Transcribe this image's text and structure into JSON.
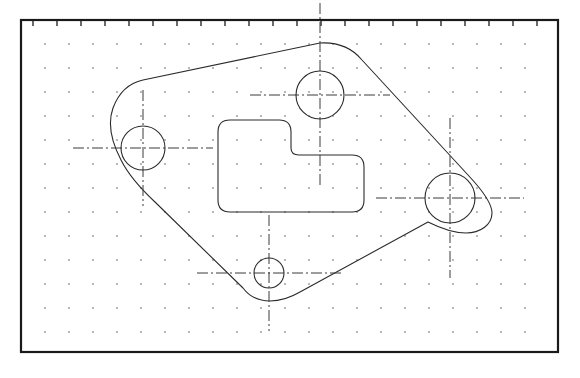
{
  "document": {
    "title_fragment": "CAD VIEW",
    "drawing_name": "gasket-plate-outline"
  },
  "canvas": {
    "width": 580,
    "height": 378,
    "background_color": "#ffffff"
  },
  "border": {
    "name": "drawing-frame",
    "x": 21,
    "y": 20,
    "width": 537,
    "height": 332,
    "stroke_color": "#1a1a1a",
    "stroke_width": 2.2
  },
  "ruler": {
    "name": "top-scale-bar",
    "tick_count": 22,
    "tick_spacing": 24,
    "tick_length": 5,
    "start_x": 33,
    "y": 21,
    "stroke_color": "#2b2b2b"
  },
  "grid": {
    "name": "snap-grid",
    "spacing": 24,
    "origin_x": 45,
    "origin_y": 44,
    "cols": 21,
    "rows": 13,
    "dot_color": "#8a8a8a",
    "dot_size": 1.1
  },
  "geometry": {
    "stroke_color": "#2a2a2a",
    "stroke_width": 1.1,
    "outline": {
      "name": "part-outline",
      "path": "M 143 80 L 320 43 C 338 42 352 48 362 60 L 468 175 C 486 194 492 206 492 213 C 492 225 480 233 466 233 C 452 233 440 228 428 222 L 300 292 C 288 299 278 301 270 301 C 258 301 249 296 243 288 L 155 202 C 140 188 128 174 121 160 C 110 139 108 122 113 108 C 119 92 129 83 143 80 Z",
      "description": "closed irregular plate profile with large left arc, straight top edge, swept right lobe and diagonal bottom edges"
    },
    "pocket": {
      "name": "l-shaped-pocket",
      "path": "M 230 120 L 279 120 Q 291 120 291 132 L 291 148 Q 291 155 299 155 L 352 155 Q 364 155 364 167 L 364 200 Q 364 212 352 212 L 230 212 Q 218 212 218 200 L 218 132 Q 218 120 230 120 Z",
      "corner_radius": 12,
      "description": "mirrored L-shaped interior cutout with filleted corners"
    },
    "holes": [
      {
        "name": "hole-left",
        "cx": 143,
        "cy": 148,
        "r": 22,
        "center_mark_h": 70,
        "center_mark_v": 58
      },
      {
        "name": "hole-top",
        "cx": 320,
        "cy": 95,
        "r": 24,
        "center_mark_h": 70,
        "center_mark_v": 92
      },
      {
        "name": "hole-right",
        "cx": 450,
        "cy": 198,
        "r": 25,
        "center_mark_h": 74,
        "center_mark_v": 80
      },
      {
        "name": "hole-bottom",
        "cx": 269,
        "cy": 273,
        "r": 15,
        "center_mark_h": 72,
        "center_mark_v": 58
      }
    ],
    "centerline": {
      "dash_pattern": "11 3 2 3",
      "stroke_color": "#3a3a3a",
      "stroke_width": 1.0
    }
  }
}
